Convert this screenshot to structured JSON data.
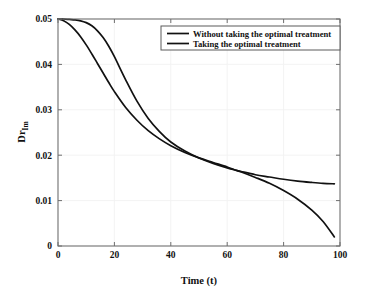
{
  "chart_data": {
    "type": "line",
    "title": "",
    "xlabel": "Time (t)",
    "ylabel": "Dr",
    "ylabel_subscript": "Im",
    "ylabel_full": "Dr_Im",
    "xlim": [
      0,
      100
    ],
    "ylim": [
      0,
      0.05
    ],
    "xticks": [
      0,
      20,
      40,
      60,
      80,
      100
    ],
    "xtick_labels": [
      "0",
      "20",
      "40",
      "60",
      "80",
      "100"
    ],
    "yticks": [
      0,
      0.01,
      0.02,
      0.03,
      0.04,
      0.05
    ],
    "ytick_labels": [
      "0",
      "0.01",
      "0.02",
      "0.03",
      "0.04",
      "0.05"
    ],
    "grid": true,
    "legend_position": "top-right",
    "line_color": "#111111",
    "series": [
      {
        "name": "Without taking the optimal treatment",
        "color": "#111111",
        "x": [
          0,
          2,
          4,
          6,
          8,
          10,
          12,
          14,
          16,
          18,
          20,
          24,
          28,
          32,
          36,
          40,
          45,
          50,
          55,
          60,
          63,
          65,
          70,
          75,
          80,
          85,
          90,
          94,
          98
        ],
        "y": [
          0.05,
          0.0496,
          0.0488,
          0.0476,
          0.0461,
          0.0443,
          0.0423,
          0.0402,
          0.0381,
          0.036,
          0.034,
          0.0305,
          0.0277,
          0.0254,
          0.0236,
          0.0221,
          0.0206,
          0.0194,
          0.0184,
          0.0174,
          0.0167,
          0.0163,
          0.0151,
          0.0138,
          0.0122,
          0.0103,
          0.0079,
          0.0054,
          0.002
        ]
      },
      {
        "name": "Taking the optimal treatment",
        "color": "#111111",
        "x": [
          0,
          2,
          4,
          6,
          8,
          10,
          12,
          14,
          16,
          18,
          20,
          24,
          28,
          32,
          36,
          40,
          45,
          50,
          55,
          60,
          63,
          65,
          70,
          75,
          80,
          85,
          90,
          94,
          98
        ],
        "y": [
          0.05,
          0.05,
          0.0499,
          0.0498,
          0.0496,
          0.0492,
          0.0485,
          0.0474,
          0.0459,
          0.044,
          0.0417,
          0.0366,
          0.0319,
          0.0281,
          0.0252,
          0.0229,
          0.0209,
          0.0194,
          0.0182,
          0.0172,
          0.0167,
          0.0164,
          0.0157,
          0.0152,
          0.0147,
          0.0143,
          0.014,
          0.0138,
          0.0137
        ]
      }
    ],
    "intersection": {
      "x": 63,
      "y": 0.0167
    },
    "start_value": 0.05
  }
}
